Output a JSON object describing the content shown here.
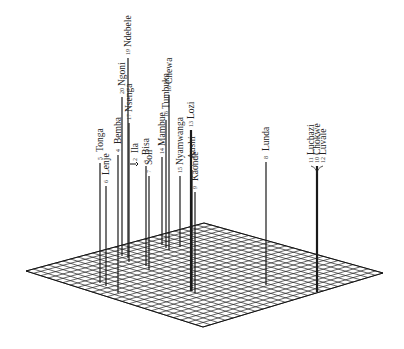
{
  "figure": {
    "grid_divisions": 24
  },
  "spikes": [
    {
      "name": "Tonga",
      "number": "5"
    },
    {
      "name": "Lenje",
      "number": "6"
    },
    {
      "name": "Bemba",
      "number": "4"
    },
    {
      "name": "Ngoni",
      "number": "20"
    },
    {
      "name": "Ndebele",
      "number": "19"
    },
    {
      "name": "Nsenga",
      "number": "17"
    },
    {
      "name": "Ila",
      "number": "2"
    },
    {
      "name": "Bisa",
      "number": "3"
    },
    {
      "name": "Soli",
      "number": "7"
    },
    {
      "name": "Mambue",
      "number": "14"
    },
    {
      "name": "Tumbuka",
      "number": "16"
    },
    {
      "name": "Chewa",
      "number": "18"
    },
    {
      "name": "Nyamwanga",
      "number": "15"
    },
    {
      "name": "Lozi",
      "number": "13"
    },
    {
      "name": "Aushi",
      "number": "1"
    },
    {
      "name": "Kaonde",
      "number": "9"
    },
    {
      "name": "Lunda",
      "number": "8"
    },
    {
      "name": "Luchazi",
      "number": "11"
    },
    {
      "name": "Chokwe",
      "number": "10"
    },
    {
      "name": "Luvale",
      "number": "12"
    }
  ]
}
